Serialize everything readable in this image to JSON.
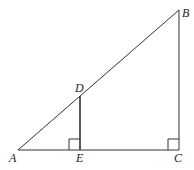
{
  "figure": {
    "type": "geometry",
    "points": {
      "A": {
        "label": "A",
        "x": 18,
        "y": 150
      },
      "B": {
        "label": "B",
        "x": 179,
        "y": 10
      },
      "C": {
        "label": "C",
        "x": 179,
        "y": 150
      },
      "D": {
        "label": "D",
        "x": 80,
        "y": 96
      },
      "E": {
        "label": "E",
        "x": 80,
        "y": 150
      }
    },
    "segments": [
      "AB",
      "BC",
      "AC",
      "DE"
    ],
    "right_angles": [
      "E",
      "C"
    ],
    "labels": {
      "A": "A",
      "B": "B",
      "C": "C",
      "D": "D",
      "E": "E"
    },
    "stroke_color": "#333333"
  }
}
